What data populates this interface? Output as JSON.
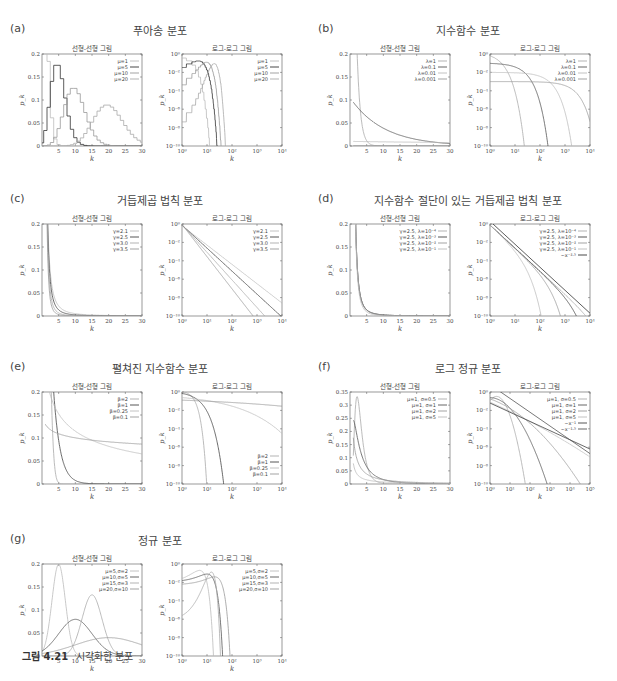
{
  "caption": {
    "label": "그림 4.21",
    "text": "시각화한 분포"
  },
  "subplot_titles": {
    "linear": "선형-선형 그림",
    "loglog": "로그-로그 그림"
  },
  "xlabel": "k",
  "ylabel": "p_k",
  "chart_data": [
    {
      "id": "a",
      "letter": "(a)",
      "title": "푸아송 분포",
      "linear": {
        "type": "line",
        "step": true,
        "xlim": [
          0,
          30
        ],
        "ylim": [
          0,
          0.2
        ],
        "xticks": [
          "5",
          "10",
          "15",
          "20",
          "25",
          "30"
        ],
        "yticks": [
          "0",
          "0.05",
          "0.1",
          "0.15",
          "0.2"
        ]
      },
      "loglog": {
        "type": "line",
        "xlim": [
          0,
          4
        ],
        "ylim": [
          -10,
          0
        ],
        "xticks": [
          "10⁰",
          "10¹",
          "10²",
          "10³",
          "10⁴"
        ],
        "yticks": [
          "10⁻¹⁰",
          "10⁻⁸",
          "10⁻⁶",
          "10⁻⁴",
          "10⁻²",
          "10⁰"
        ]
      },
      "dist": "poisson",
      "series": [
        {
          "name": "μ=1",
          "param": 1,
          "color": "#bbbbbb"
        },
        {
          "name": "μ=5",
          "param": 5,
          "color": "#333333"
        },
        {
          "name": "μ=10",
          "param": 10,
          "color": "#999999"
        },
        {
          "name": "μ=20",
          "param": 20,
          "color": "#aaaaaa"
        }
      ]
    },
    {
      "id": "b",
      "letter": "(b)",
      "title": "지수함수 분포",
      "linear": {
        "type": "line",
        "xlim": [
          0,
          30
        ],
        "ylim": [
          0,
          0.2
        ],
        "xticks": [
          "5",
          "10",
          "15",
          "20",
          "25",
          "30"
        ],
        "yticks": [
          "0",
          "0.05",
          "0.1",
          "0.15",
          "0.2"
        ]
      },
      "loglog": {
        "type": "line",
        "xlim": [
          0,
          4
        ],
        "ylim": [
          -10,
          0
        ],
        "xticks": [
          "10⁰",
          "10¹",
          "10²",
          "10³",
          "10⁴"
        ],
        "yticks": [
          "10⁻¹⁰",
          "10⁻⁸",
          "10⁻⁶",
          "10⁻⁴",
          "10⁻²",
          "10⁰"
        ]
      },
      "dist": "exponential",
      "series": [
        {
          "name": "λ=1",
          "param": 1,
          "color": "#aaaaaa"
        },
        {
          "name": "λ=0.1",
          "param": 0.1,
          "color": "#555555"
        },
        {
          "name": "λ=0.01",
          "param": 0.01,
          "color": "#bbbbbb"
        },
        {
          "name": "λ=0.001",
          "param": 0.001,
          "color": "#999999"
        }
      ]
    },
    {
      "id": "c",
      "letter": "(c)",
      "title": "거듭제곱 법칙 분포",
      "linear": {
        "type": "line",
        "xlim": [
          0,
          30
        ],
        "ylim": [
          0,
          0.2
        ],
        "xticks": [
          "5",
          "10",
          "15",
          "20",
          "25",
          "30"
        ],
        "yticks": [
          "0",
          "0.05",
          "0.1",
          "0.15",
          "0.2"
        ]
      },
      "loglog": {
        "type": "line",
        "xlim": [
          0,
          4
        ],
        "ylim": [
          -10,
          0
        ],
        "xticks": [
          "10⁰",
          "10¹",
          "10²",
          "10³",
          "10⁴"
        ],
        "yticks": [
          "10⁻¹⁰",
          "10⁻⁸",
          "10⁻⁶",
          "10⁻⁴",
          "10⁻²",
          "10⁰"
        ]
      },
      "dist": "powerlaw",
      "series": [
        {
          "name": "γ=2.1",
          "param": 2.1,
          "color": "#bbbbbb"
        },
        {
          "name": "γ=2.5",
          "param": 2.5,
          "color": "#444444"
        },
        {
          "name": "γ=3.0",
          "param": 3.0,
          "color": "#aaaaaa"
        },
        {
          "name": "γ=3.5",
          "param": 3.5,
          "color": "#999999"
        }
      ]
    },
    {
      "id": "d",
      "letter": "(d)",
      "title": "지수함수 절단이 있는 거듭제곱 법칙 분포",
      "linear": {
        "type": "line",
        "xlim": [
          0,
          30
        ],
        "ylim": [
          0,
          0.2
        ],
        "xticks": [
          "5",
          "10",
          "15",
          "20",
          "25",
          "30"
        ],
        "yticks": [
          "0",
          "0.05",
          "0.1",
          "0.15",
          "0.2"
        ]
      },
      "loglog": {
        "type": "line",
        "xlim": [
          0,
          4
        ],
        "ylim": [
          -10,
          0
        ],
        "xticks": [
          "10⁰",
          "10¹",
          "10²",
          "10³",
          "10⁴"
        ],
        "yticks": [
          "10⁻¹⁰",
          "10⁻⁸",
          "10⁻⁶",
          "10⁻⁴",
          "10⁻²",
          "10⁰"
        ]
      },
      "dist": "powercut",
      "series": [
        {
          "name": "γ=2.5, λ=10⁻⁴",
          "param": 0.0001,
          "color": "#aaaaaa"
        },
        {
          "name": "γ=2.5, λ=10⁻³",
          "param": 0.001,
          "color": "#444444"
        },
        {
          "name": "γ=2.5, λ=10⁻²",
          "param": 0.01,
          "color": "#999999"
        },
        {
          "name": "γ=2.5, λ=10⁻¹",
          "param": 0.1,
          "color": "#bbbbbb"
        }
      ],
      "loglog_extra": [
        {
          "name": "~x⁻²·⁵",
          "slope": -2.5,
          "offset": 0.3,
          "color": "#333333"
        }
      ]
    },
    {
      "id": "e",
      "letter": "(e)",
      "title": "펼쳐진 지수함수 분포",
      "linear": {
        "type": "line",
        "xlim": [
          0,
          30
        ],
        "ylim": [
          0,
          0.2
        ],
        "xticks": [
          "5",
          "10",
          "15",
          "20",
          "25",
          "30"
        ],
        "yticks": [
          "0",
          "0.05",
          "0.1",
          "0.15",
          "0.2"
        ]
      },
      "loglog": {
        "type": "line",
        "xlim": [
          0,
          4
        ],
        "ylim": [
          -10,
          0
        ],
        "legend_position": "bottom-right",
        "xticks": [
          "10⁰",
          "10¹",
          "10²",
          "10³",
          "10⁴"
        ],
        "yticks": [
          "10⁻¹⁰",
          "10⁻⁸",
          "10⁻⁶",
          "10⁻⁴",
          "10⁻²",
          "10⁰"
        ]
      },
      "dist": "stretched",
      "series": [
        {
          "name": "β=2",
          "param": 2,
          "color": "#aaaaaa"
        },
        {
          "name": "β=1",
          "param": 1,
          "color": "#444444"
        },
        {
          "name": "β=0.25",
          "param": 0.25,
          "color": "#bbbbbb"
        },
        {
          "name": "β=0.1",
          "param": 0.1,
          "color": "#999999"
        }
      ]
    },
    {
      "id": "f",
      "letter": "(f)",
      "title": "로그 정규 분포",
      "linear": {
        "type": "line",
        "xlim": [
          0,
          30
        ],
        "ylim": [
          0,
          0.35
        ],
        "xticks": [
          "5",
          "10",
          "15",
          "20",
          "25",
          "30"
        ],
        "yticks": [
          "0",
          "0.05",
          "0.1",
          "0.15",
          "0.2",
          "0.25",
          "0.3",
          "0.35"
        ]
      },
      "loglog": {
        "type": "line",
        "xlim": [
          0,
          5
        ],
        "ylim": [
          -10,
          0
        ],
        "xticks": [
          "10⁰",
          "10¹",
          "10²",
          "10³",
          "10⁴",
          "10⁵"
        ],
        "yticks": [
          "10⁻¹⁰",
          "10⁻⁸",
          "10⁻⁶",
          "10⁻⁴",
          "10⁻²",
          "10⁰"
        ]
      },
      "dist": "lognormal",
      "series": [
        {
          "name": "μ=1, σ=0.5",
          "param": 0.5,
          "color": "#aaaaaa"
        },
        {
          "name": "μ=1, σ=1",
          "param": 1,
          "color": "#555555"
        },
        {
          "name": "μ=1, σ=2",
          "param": 2,
          "color": "#999999"
        },
        {
          "name": "μ=1, σ=5",
          "param": 5,
          "color": "#bbbbbb"
        }
      ],
      "loglog_extra": [
        {
          "name": "~x⁻¹",
          "slope": -1,
          "offset": -1.2,
          "color": "#444444"
        },
        {
          "name": "~x⁻¹·⁵",
          "slope": -1.5,
          "offset": 0.8,
          "color": "#555555"
        }
      ]
    },
    {
      "id": "g",
      "letter": "(g)",
      "title": "정규 분포",
      "linear": {
        "type": "line",
        "xlim": [
          0,
          30
        ],
        "ylim": [
          0,
          0.2
        ],
        "xticks": [
          "5",
          "10",
          "15",
          "20",
          "25",
          "30"
        ],
        "yticks": [
          "0",
          "0.05",
          "0.1",
          "0.15",
          "0.2"
        ]
      },
      "loglog": {
        "type": "line",
        "xlim": [
          0,
          4
        ],
        "ylim": [
          -10,
          0
        ],
        "xticks": [
          "10⁰",
          "10¹",
          "10²",
          "10³",
          "10⁴"
        ],
        "yticks": [
          "10⁻¹⁰",
          "10⁻⁸",
          "10⁻⁶",
          "10⁻⁴",
          "10⁻²",
          "10⁰"
        ]
      },
      "dist": "normal",
      "series": [
        {
          "name": "μ=5,σ=2",
          "mu": 5,
          "sigma": 2,
          "color": "#bbbbbb"
        },
        {
          "name": "μ=10,σ=5",
          "mu": 10,
          "sigma": 5,
          "color": "#555555"
        },
        {
          "name": "μ=15,σ=3",
          "mu": 15,
          "sigma": 3,
          "color": "#aaaaaa"
        },
        {
          "name": "μ=20,σ=10",
          "mu": 20,
          "sigma": 10,
          "color": "#999999"
        }
      ]
    }
  ]
}
